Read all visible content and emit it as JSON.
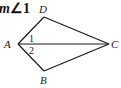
{
  "caption": {
    "prefix": "m",
    "symbol": "∠1"
  },
  "diagram": {
    "type": "kite-quadrilateral",
    "points": {
      "A": {
        "label": "A",
        "x": 18,
        "y": 44
      },
      "B": {
        "label": "B",
        "x": 44,
        "y": 71
      },
      "C": {
        "label": "C",
        "x": 109,
        "y": 44
      },
      "D": {
        "label": "D",
        "x": 44,
        "y": 17
      }
    },
    "segments": [
      "AD",
      "DC",
      "CB",
      "BA",
      "AC"
    ],
    "angle_labels": [
      {
        "label": "1",
        "position": "above AC at A"
      },
      {
        "label": "2",
        "position": "below AC at A"
      }
    ],
    "colors": {
      "stroke": "#1a1a1a",
      "text": "#222222"
    }
  }
}
